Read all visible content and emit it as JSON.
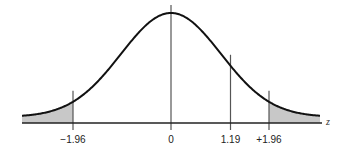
{
  "chart_data": {
    "type": "area",
    "title": "",
    "subtitle": "",
    "xlabel": "z",
    "ylabel": "",
    "distribution": "standard normal",
    "xlim": [
      -3,
      3
    ],
    "grid": false,
    "legend": null,
    "shaded_regions": [
      {
        "name": "left-tail",
        "from": -3,
        "to": -1.96
      },
      {
        "name": "right-tail",
        "from": 1.96,
        "to": 3
      }
    ],
    "reference_lines": [
      {
        "name": "neg-1-96",
        "x": -1.96,
        "label": "−1.96"
      },
      {
        "name": "zero",
        "x": 0,
        "label": "0"
      },
      {
        "name": "pos-1-19",
        "x": 1.19,
        "label": "1.19"
      },
      {
        "name": "pos-1-96",
        "x": 1.96,
        "label": "+1.96"
      }
    ],
    "colors": {
      "curve": "#111111",
      "shade": "#c8c8c8",
      "lines": "#555555",
      "axis": "#222222"
    }
  }
}
